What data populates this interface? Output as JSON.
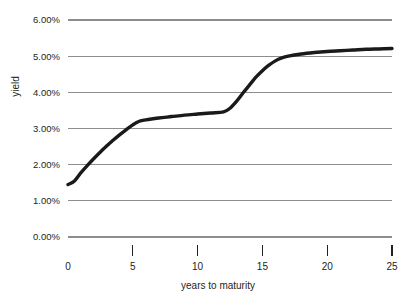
{
  "chart_data": {
    "type": "line",
    "title": "",
    "subtitle": "",
    "xlabel": "years to maturity",
    "ylabel": "yield",
    "xlim": [
      0,
      25
    ],
    "ylim": [
      0,
      6
    ],
    "grid": true,
    "legend": false,
    "legend_position": "none",
    "line_color": "#1a1a1a",
    "grid_color": "#8d8d8d",
    "text_color": "#231f20",
    "background_color": "#ffffff",
    "y_tick_labels": [
      "0.00%",
      "1.00%",
      "2.00%",
      "3.00%",
      "4.00%",
      "5.00%",
      "6.00%"
    ],
    "y_tick_values": [
      0,
      1,
      2,
      3,
      4,
      5,
      6
    ],
    "x_tick_labels": [
      "0",
      "5",
      "10",
      "15",
      "20",
      "25"
    ],
    "x_tick_values": [
      0,
      5,
      10,
      15,
      20,
      25
    ],
    "x_tickmarks_drawn_at": [
      5,
      10,
      15,
      20,
      25
    ],
    "series": [
      {
        "name": "yield curve",
        "x": [
          0,
          0.5,
          1,
          1.5,
          2,
          2.5,
          3,
          3.5,
          4,
          4.5,
          5,
          5.5,
          6,
          7,
          8,
          9,
          10,
          11,
          12,
          12.5,
          13,
          13.5,
          14,
          14.5,
          15,
          15.5,
          16,
          16.5,
          17,
          18,
          19,
          20,
          21,
          22,
          23,
          24,
          25
        ],
        "y": [
          1.45,
          1.55,
          1.78,
          1.98,
          2.17,
          2.35,
          2.52,
          2.68,
          2.83,
          2.97,
          3.1,
          3.2,
          3.24,
          3.29,
          3.33,
          3.37,
          3.4,
          3.43,
          3.46,
          3.56,
          3.75,
          3.98,
          4.2,
          4.42,
          4.6,
          4.75,
          4.87,
          4.95,
          5.0,
          5.06,
          5.1,
          5.13,
          5.15,
          5.17,
          5.19,
          5.2,
          5.21
        ]
      }
    ]
  },
  "axes": {
    "y_title": "yield",
    "x_title": "years to maturity"
  }
}
